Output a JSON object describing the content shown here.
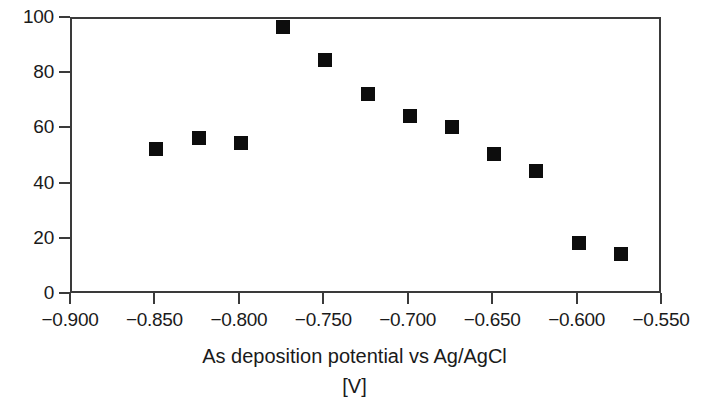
{
  "chart_data": {
    "type": "scatter",
    "title": "",
    "xlabel": "As deposition potential vs Ag/AgCl",
    "xunits": "[V]",
    "ylabel": "",
    "xlim": [
      -0.9,
      -0.55
    ],
    "ylim": [
      0,
      100
    ],
    "grid": false,
    "legend": null,
    "marker": {
      "shape": "square",
      "color": "#0d0d0d",
      "size_px": 14
    },
    "xticks": [
      -0.9,
      -0.85,
      -0.8,
      -0.75,
      -0.7,
      -0.65,
      -0.6,
      -0.55
    ],
    "xtick_labels": [
      "−0.900",
      "−0.850",
      "−0.800",
      "−0.750",
      "−0.700",
      "−0.650",
      "−0.600",
      "−0.550"
    ],
    "yticks": [
      0,
      20,
      40,
      60,
      80,
      100
    ],
    "ytick_labels": [
      "0",
      "20",
      "40",
      "60",
      "80",
      "100"
    ],
    "points": [
      {
        "x": -0.85,
        "y": 53
      },
      {
        "x": -0.825,
        "y": 57
      },
      {
        "x": -0.8,
        "y": 55
      },
      {
        "x": -0.775,
        "y": 97
      },
      {
        "x": -0.75,
        "y": 85
      },
      {
        "x": -0.725,
        "y": 73
      },
      {
        "x": -0.7,
        "y": 65
      },
      {
        "x": -0.675,
        "y": 61
      },
      {
        "x": -0.65,
        "y": 51
      },
      {
        "x": -0.625,
        "y": 45
      },
      {
        "x": -0.6,
        "y": 19
      },
      {
        "x": -0.575,
        "y": 15
      }
    ]
  },
  "colors": {
    "axis": "#3a3a3a",
    "marker": "#0d0d0d",
    "text": "#1a1a1a",
    "background": "#ffffff"
  }
}
